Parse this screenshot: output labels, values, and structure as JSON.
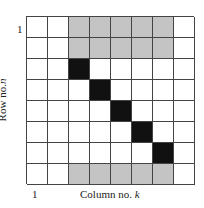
{
  "diagram": {
    "type": "matrix-grid",
    "rows": 8,
    "cols": 8,
    "cells": [
      [
        "white",
        "white",
        "gray",
        "gray",
        "gray",
        "gray",
        "gray",
        "white"
      ],
      [
        "white",
        "white",
        "gray",
        "gray",
        "gray",
        "gray",
        "gray",
        "white"
      ],
      [
        "white",
        "white",
        "black",
        "white",
        "white",
        "white",
        "white",
        "white"
      ],
      [
        "white",
        "white",
        "white",
        "black",
        "white",
        "white",
        "white",
        "white"
      ],
      [
        "white",
        "white",
        "white",
        "white",
        "black",
        "white",
        "white",
        "white"
      ],
      [
        "white",
        "white",
        "white",
        "white",
        "white",
        "black",
        "white",
        "white"
      ],
      [
        "white",
        "white",
        "white",
        "white",
        "white",
        "white",
        "black",
        "white"
      ],
      [
        "white",
        "white",
        "gray",
        "gray",
        "gray",
        "gray",
        "gray",
        "white"
      ]
    ],
    "colors": {
      "white": "#ffffff",
      "gray": "#c4c4c4",
      "black": "#111111",
      "grid_line": "#444444"
    }
  },
  "labels": {
    "row_start": "1",
    "col_start": "1",
    "x_axis_text": "Column no. ",
    "x_axis_var": "k",
    "y_axis_text": "Row no. ",
    "y_axis_var": "n"
  }
}
